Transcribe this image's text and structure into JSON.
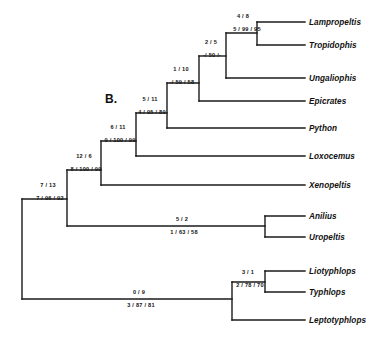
{
  "figure": {
    "panel_label": "B.",
    "line_color": "#1a1a1a",
    "text_color": "#111111"
  },
  "taxa": [
    {
      "name": "Lampropeltis",
      "tip_y": 22,
      "branch_x": 257
    },
    {
      "name": "Tropidophis",
      "tip_y": 45,
      "branch_x": 257
    },
    {
      "name": "Ungaliophis",
      "tip_y": 78,
      "branch_x": 226
    },
    {
      "name": "Epicrates",
      "tip_y": 101,
      "branch_x": 199
    },
    {
      "name": "Python",
      "tip_y": 128,
      "branch_x": 167
    },
    {
      "name": "Loxocemus",
      "tip_y": 156,
      "branch_x": 136
    },
    {
      "name": "Xenopeltis",
      "tip_y": 185,
      "branch_x": 101
    },
    {
      "name": "Anilius",
      "tip_y": 216,
      "branch_x": 265
    },
    {
      "name": "Uropeltis",
      "tip_y": 237,
      "branch_x": 265
    },
    {
      "name": "Liotyphlops",
      "tip_y": 271,
      "branch_x": 265
    },
    {
      "name": "Typhlops",
      "tip_y": 292,
      "branch_x": 265
    },
    {
      "name": "Leptotyphlops",
      "tip_y": 320,
      "branch_x": 232
    }
  ],
  "nodes": [
    {
      "id": "lampropeltis-tropidophis",
      "above": "4 / 8",
      "below": "5 / 99 / 95",
      "above_x": 243,
      "above_y": 16,
      "below_x": 247,
      "below_y": 29
    },
    {
      "id": "ungaliophis-clade",
      "above": "2 / 5",
      "below": "-/ 50 /-",
      "above_x": 211,
      "above_y": 42,
      "below_x": 212,
      "below_y": 55
    },
    {
      "id": "epicrates-clade",
      "above": "1 / 10",
      "below": "-/ 59 / 58",
      "above_x": 181,
      "above_y": 69,
      "below_x": 182,
      "below_y": 82
    },
    {
      "id": "python-clade",
      "above": "5 / 11",
      "below": "4 / 95 / 89",
      "above_x": 150,
      "above_y": 99,
      "below_x": 152,
      "below_y": 112
    },
    {
      "id": "loxocemus-clade",
      "above": "6 / 11",
      "below": "9 / 100 / 99",
      "above_x": 118,
      "above_y": 127,
      "below_x": 120,
      "below_y": 140
    },
    {
      "id": "xenopeltis-clade",
      "above": "12 / 6",
      "below": "8 / 100 / 99",
      "above_x": 84,
      "above_y": 156,
      "below_x": 86,
      "below_y": 169
    },
    {
      "id": "alethinophidia-root",
      "above": "7 / 13",
      "below": "7 / 96 / 92",
      "above_x": 48,
      "above_y": 185,
      "below_x": 50,
      "below_y": 198
    },
    {
      "id": "anilius-uropeltis",
      "above": "5 / 2",
      "below": "1 / 63 / 58",
      "above_x": 182,
      "above_y": 219,
      "below_x": 184,
      "below_y": 232
    },
    {
      "id": "liotyphlops-typhlops",
      "above": "3 / 1",
      "below": "2 / 78 / 70",
      "above_x": 248,
      "above_y": 272,
      "below_x": 250,
      "below_y": 285
    },
    {
      "id": "scolecophidia-clade",
      "above": "0 / 9",
      "below": "3 / 87 / 81",
      "above_x": 139,
      "above_y": 292,
      "below_x": 141,
      "below_y": 305
    }
  ],
  "branches": [
    {
      "name": "tip-lampropeltis",
      "x1": 257,
      "y1": 22,
      "x2": 305,
      "y2": 22
    },
    {
      "name": "tip-tropidophis",
      "x1": 257,
      "y1": 45,
      "x2": 305,
      "y2": 45
    },
    {
      "name": "vertical-lampropeltis-tropidophis",
      "x1": 257,
      "y1": 22,
      "x2": 257,
      "y2": 45
    },
    {
      "name": "internal-lampro-tropi-stem",
      "x1": 226,
      "y1": 33,
      "x2": 257,
      "y2": 33
    },
    {
      "name": "tip-ungaliophis",
      "x1": 226,
      "y1": 78,
      "x2": 305,
      "y2": 78
    },
    {
      "name": "vertical-ungaliophis-node",
      "x1": 226,
      "y1": 33,
      "x2": 226,
      "y2": 78
    },
    {
      "name": "internal-ungaliophis-stem",
      "x1": 199,
      "y1": 56,
      "x2": 226,
      "y2": 56
    },
    {
      "name": "tip-epicrates",
      "x1": 199,
      "y1": 101,
      "x2": 305,
      "y2": 101
    },
    {
      "name": "vertical-epicrates-node",
      "x1": 199,
      "y1": 56,
      "x2": 199,
      "y2": 101
    },
    {
      "name": "internal-epicrates-stem",
      "x1": 167,
      "y1": 83,
      "x2": 199,
      "y2": 83
    },
    {
      "name": "tip-python",
      "x1": 167,
      "y1": 128,
      "x2": 305,
      "y2": 128
    },
    {
      "name": "vertical-python-node",
      "x1": 167,
      "y1": 83,
      "x2": 167,
      "y2": 128
    },
    {
      "name": "internal-python-stem",
      "x1": 136,
      "y1": 113,
      "x2": 167,
      "y2": 113
    },
    {
      "name": "tip-loxocemus",
      "x1": 136,
      "y1": 156,
      "x2": 305,
      "y2": 156
    },
    {
      "name": "vertical-loxocemus-node",
      "x1": 136,
      "y1": 113,
      "x2": 136,
      "y2": 156
    },
    {
      "name": "internal-loxocemus-stem",
      "x1": 101,
      "y1": 141,
      "x2": 136,
      "y2": 141
    },
    {
      "name": "tip-xenopeltis",
      "x1": 101,
      "y1": 185,
      "x2": 305,
      "y2": 185
    },
    {
      "name": "vertical-xenopeltis-node",
      "x1": 101,
      "y1": 141,
      "x2": 101,
      "y2": 185
    },
    {
      "name": "internal-xenopeltis-stem",
      "x1": 67,
      "y1": 170,
      "x2": 101,
      "y2": 170
    },
    {
      "name": "tip-anilius",
      "x1": 265,
      "y1": 216,
      "x2": 305,
      "y2": 216
    },
    {
      "name": "tip-uropeltis",
      "x1": 265,
      "y1": 237,
      "x2": 305,
      "y2": 237
    },
    {
      "name": "vertical-anilius-uropeltis",
      "x1": 265,
      "y1": 216,
      "x2": 265,
      "y2": 237
    },
    {
      "name": "internal-anilius-uropeltis-stem",
      "x1": 67,
      "y1": 226,
      "x2": 265,
      "y2": 226
    },
    {
      "name": "vertical-alethinophidia",
      "x1": 67,
      "y1": 170,
      "x2": 67,
      "y2": 226
    },
    {
      "name": "internal-alethinophidia-stem",
      "x1": 22,
      "y1": 199,
      "x2": 67,
      "y2": 199
    },
    {
      "name": "tip-liotyphlops",
      "x1": 265,
      "y1": 271,
      "x2": 305,
      "y2": 271
    },
    {
      "name": "tip-typhlops",
      "x1": 265,
      "y1": 292,
      "x2": 305,
      "y2": 292
    },
    {
      "name": "vertical-liotyphlops-typhlops",
      "x1": 265,
      "y1": 271,
      "x2": 265,
      "y2": 292
    },
    {
      "name": "internal-liotyphlops-typhlops-stem",
      "x1": 232,
      "y1": 282,
      "x2": 265,
      "y2": 282
    },
    {
      "name": "tip-leptotyphlops",
      "x1": 232,
      "y1": 320,
      "x2": 305,
      "y2": 320
    },
    {
      "name": "vertical-scolecophidia",
      "x1": 232,
      "y1": 282,
      "x2": 232,
      "y2": 320
    },
    {
      "name": "internal-scolecophidia-stem",
      "x1": 22,
      "y1": 299,
      "x2": 232,
      "y2": 299
    },
    {
      "name": "vertical-root",
      "x1": 22,
      "y1": 199,
      "x2": 22,
      "y2": 299
    }
  ],
  "layout": {
    "panel_label_x": 105,
    "panel_label_y": 92,
    "taxon_label_x": 309
  }
}
